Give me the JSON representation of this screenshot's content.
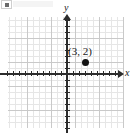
{
  "figure": {
    "width": 133,
    "height": 135,
    "background_color": "#ffffff"
  },
  "axes": {
    "x_label": "x",
    "y_label": "y",
    "axis_color": "#2b2b2b",
    "origin_px": [
      67,
      74
    ],
    "units_per_px": 6,
    "x_range": [
      -10,
      9
    ],
    "y_range": [
      -9,
      9
    ],
    "tick_interval": 1,
    "tick_marks_visible": true
  },
  "grid": {
    "minor_color": "#e6e6e6",
    "major_color": "#c9c9c9",
    "minor_spacing_px": 6,
    "major_spacing_px": 24,
    "visible": true
  },
  "point": {
    "label": "(3, 2)",
    "x": 3,
    "y": 2,
    "color": "#121212",
    "marker": "filled-circle"
  },
  "artifact": {
    "note": "scan-smudge"
  },
  "chart_data": {
    "type": "scatter",
    "title": "",
    "xlabel": "x",
    "ylabel": "y",
    "xlim": [
      -10,
      9
    ],
    "ylim": [
      -9,
      9
    ],
    "grid": true,
    "legend": "none",
    "series": [
      {
        "name": "plotted point",
        "points": [
          {
            "x": 3,
            "y": 2,
            "label": "(3, 2)"
          }
        ],
        "color": "#121212",
        "marker": "filled-circle"
      }
    ],
    "annotations": [
      {
        "text": "(3, 2)",
        "x": 3,
        "y": 2,
        "position": "above-left"
      }
    ]
  }
}
